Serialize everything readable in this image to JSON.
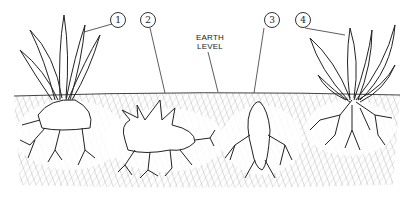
{
  "figure": {
    "type": "botanical line illustration",
    "labels": {
      "earth_level_line1": "EARTH",
      "earth_level_line2": "LEVEL"
    },
    "callouts": [
      {
        "number": "1",
        "points_to": "left plant with tall narrow leaves above a bulbous root"
      },
      {
        "number": "2",
        "points_to": "earth surface above a knobbly rhizome with pointed shoots"
      },
      {
        "number": "3",
        "points_to": "elongated tuber below earth level"
      },
      {
        "number": "4",
        "points_to": "leafy plant with fibrous roots on the right"
      }
    ],
    "caption": "",
    "colors": {
      "ink": "#222222",
      "soil_hatch": "#8a8a8a",
      "background": "#ffffff"
    }
  }
}
